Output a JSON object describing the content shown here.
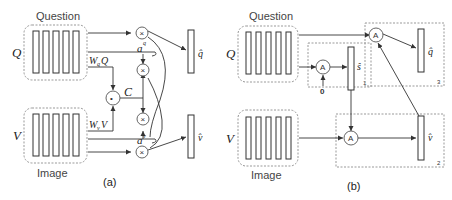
{
  "panel_a": {
    "caption": "(a)",
    "question_label": "Question",
    "image_label": "Image",
    "q_symbol": "Q",
    "v_symbol": "V",
    "wq_label": "W",
    "wq_sub": "q",
    "wq_tail": "Q",
    "wv_label": "W",
    "wv_sub": "v",
    "wv_tail": "V",
    "c_label": "C",
    "aq_label": "a",
    "aq_sup": "q",
    "av_label": "a",
    "av_sup": "v",
    "multiply_op": "×",
    "dot_op": "•",
    "q_hat": "q̂",
    "v_hat": "v̂"
  },
  "panel_b": {
    "caption": "(b)",
    "question_label": "Question",
    "image_label": "Image",
    "q_symbol": "Q",
    "v_symbol": "V",
    "attention_op": "A",
    "zero_input": "0",
    "s_hat": "ŝ",
    "q_hat": "q̂",
    "v_hat": "v̂",
    "step1": "1",
    "step2": "2",
    "step3": "3"
  }
}
